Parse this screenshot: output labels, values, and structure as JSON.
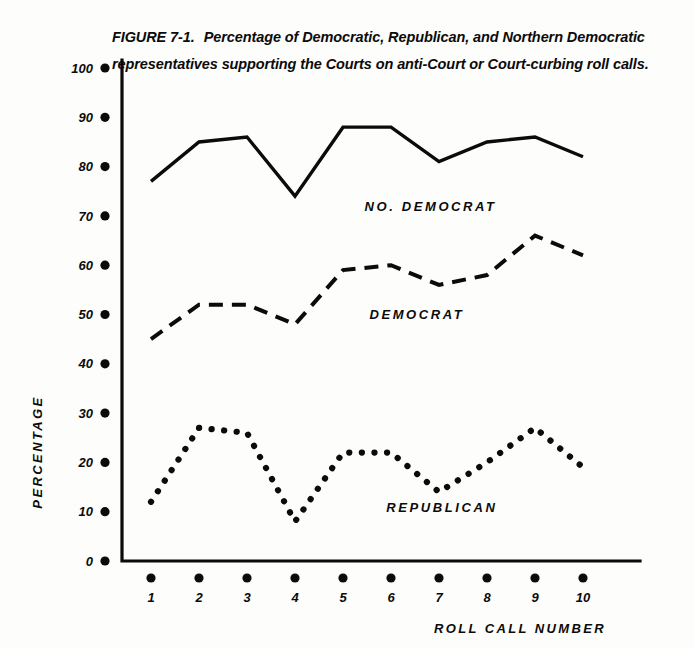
{
  "caption": {
    "figure_number": "FIGURE 7-1.",
    "text": "Percentage of Democratic, Republican, and Northern Democratic representatives supporting the Courts on anti-Court or Court-curbing roll calls."
  },
  "chart_data": {
    "type": "line",
    "title": "Percentage of Democratic, Republican, and Northern Democratic representatives supporting the Courts on anti-Court or Court-curbing roll calls.",
    "xlabel": "ROLL CALL NUMBER",
    "ylabel": "PERCENTAGE",
    "x": [
      1,
      2,
      3,
      4,
      5,
      6,
      7,
      8,
      9,
      10
    ],
    "categories": [
      "1",
      "2",
      "3",
      "4",
      "5",
      "6",
      "7",
      "8",
      "9",
      "10"
    ],
    "xlim": [
      1,
      10
    ],
    "ylim": [
      0,
      100
    ],
    "yticks": [
      0,
      10,
      20,
      30,
      40,
      50,
      60,
      70,
      80,
      90,
      100
    ],
    "ytick_labels": [
      "0",
      "10",
      "20",
      "30",
      "40",
      "50",
      "60",
      "70",
      "80",
      "90",
      "100"
    ],
    "xtick_labels": [
      "1",
      "2",
      "3",
      "4",
      "5",
      "6",
      "7",
      "8",
      "9",
      "10"
    ],
    "grid": false,
    "legend_position": "inline-annotation",
    "series": [
      {
        "name": "NO. DEMOCRAT",
        "style": "solid",
        "color": "#0b0b0b",
        "values": [
          77,
          85,
          86,
          74,
          88,
          88,
          81,
          85,
          86,
          82
        ],
        "label_x": 5.45,
        "label_y": 71
      },
      {
        "name": "DEMOCRAT",
        "style": "dashed",
        "color": "#0b0b0b",
        "values": [
          45,
          52,
          52,
          48,
          59,
          60,
          56,
          58,
          66,
          62
        ],
        "label_x": 5.55,
        "label_y": 49
      },
      {
        "name": "REPUBLICAN",
        "style": "dotted",
        "color": "#0b0b0b",
        "values": [
          12,
          27,
          26,
          8,
          22,
          22,
          14,
          20,
          27,
          19
        ],
        "label_x": 5.9,
        "label_y": 10
      }
    ]
  },
  "axes": {
    "y_axis_title": "PERCENTAGE",
    "x_axis_title": "ROLL CALL NUMBER"
  },
  "colors": {
    "ink": "#0b0b0b",
    "paper": "#fdfdfb"
  }
}
